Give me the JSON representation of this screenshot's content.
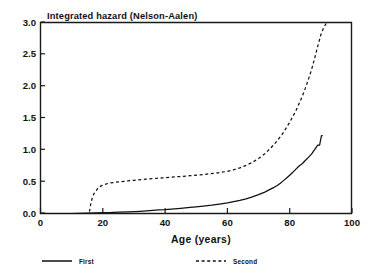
{
  "chart_data": {
    "type": "line",
    "title": "Integrated hazard  (Nelson-Aalen)",
    "xlabel": "Age  (years)",
    "ylabel": "",
    "xlim": [
      0,
      100
    ],
    "ylim": [
      0,
      3.0
    ],
    "grid": false,
    "legend_position": "below-axes",
    "xticks": [
      0,
      20,
      40,
      60,
      80,
      100
    ],
    "xtick_labels": [
      "0",
      "20",
      "40",
      "60",
      "80",
      "100"
    ],
    "yticks": [
      0.0,
      0.5,
      1.0,
      1.5,
      2.0,
      2.5,
      3.0
    ],
    "ytick_labels": [
      "0.0",
      "0.5",
      "1.0",
      "1.5",
      "2.0",
      "2.5",
      "3.0"
    ],
    "series": [
      {
        "name": "First",
        "style": "solid",
        "color": "#111111",
        "x": [
          0,
          5,
          10,
          15,
          18,
          20,
          22,
          25,
          28,
          30,
          32,
          35,
          38,
          40,
          43,
          45,
          48,
          50,
          53,
          55,
          58,
          60,
          62,
          64,
          66,
          68,
          70,
          72,
          74,
          75,
          76,
          77,
          78,
          79,
          80,
          81,
          82,
          83,
          84,
          85,
          86,
          87,
          88,
          89,
          89.6,
          90.2,
          90.6
        ],
        "y": [
          0.0,
          0.0,
          0.0,
          0.005,
          0.01,
          0.012,
          0.015,
          0.02,
          0.025,
          0.03,
          0.035,
          0.045,
          0.055,
          0.06,
          0.072,
          0.08,
          0.095,
          0.105,
          0.12,
          0.13,
          0.15,
          0.165,
          0.185,
          0.205,
          0.23,
          0.26,
          0.295,
          0.335,
          0.385,
          0.41,
          0.44,
          0.475,
          0.515,
          0.555,
          0.6,
          0.645,
          0.695,
          0.745,
          0.78,
          0.83,
          0.88,
          0.93,
          1.0,
          1.07,
          1.07,
          1.22,
          1.22
        ]
      },
      {
        "name": "Second",
        "style": "dashed",
        "color": "#111111",
        "x": [
          0,
          15.6,
          15.9,
          16.2,
          16.6,
          17.0,
          17.4,
          17.9,
          18.4,
          19.0,
          19.8,
          20.6,
          22,
          24,
          26,
          28,
          30,
          33,
          36,
          39,
          42,
          45,
          48,
          51,
          54,
          57,
          60,
          62,
          64,
          66,
          68,
          70,
          72,
          74,
          76,
          78,
          80,
          82,
          84,
          85,
          86,
          87,
          88,
          89,
          90,
          91,
          92
        ],
        "y": [
          0.0,
          0.0,
          0.08,
          0.17,
          0.24,
          0.295,
          0.33,
          0.36,
          0.395,
          0.42,
          0.44,
          0.455,
          0.475,
          0.49,
          0.5,
          0.51,
          0.52,
          0.535,
          0.545,
          0.558,
          0.57,
          0.58,
          0.592,
          0.605,
          0.62,
          0.638,
          0.66,
          0.685,
          0.715,
          0.755,
          0.8,
          0.86,
          0.935,
          1.03,
          1.14,
          1.27,
          1.43,
          1.61,
          1.83,
          1.96,
          2.1,
          2.25,
          2.43,
          2.62,
          2.8,
          2.92,
          3.0
        ]
      }
    ]
  },
  "legend": {
    "items": [
      {
        "label": "First",
        "style": "solid"
      },
      {
        "label": "Second",
        "style": "dashed"
      }
    ]
  },
  "colors": {
    "ink": "#111111",
    "background": "#ffffff"
  }
}
